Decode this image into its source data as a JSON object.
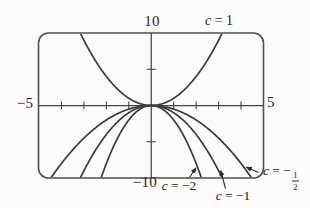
{
  "chart_data": {
    "type": "line",
    "model": "y = c*x^2 (family of parabolas, parameter c)",
    "x_range": [
      -5,
      5
    ],
    "y_range": [
      -10,
      10
    ],
    "x_tick_step": 1,
    "y_tick_step": 5,
    "grid": false,
    "legend": "inline-curve-labels",
    "axis_tick_labels": {
      "top": "10",
      "bottom": "−10",
      "left": "−5",
      "right": "5"
    },
    "series": [
      {
        "name": "c = 1",
        "c": 1,
        "points": [
          [
            -3,
            9
          ],
          [
            -2,
            4
          ],
          [
            -1,
            1
          ],
          [
            0,
            0
          ],
          [
            1,
            1
          ],
          [
            2,
            4
          ],
          [
            3,
            9
          ]
        ]
      },
      {
        "name": "c = −2",
        "c": -2,
        "points": [
          [
            -2,
            -8
          ],
          [
            -1,
            -2
          ],
          [
            0,
            0
          ],
          [
            1,
            -2
          ],
          [
            2,
            -8
          ]
        ]
      },
      {
        "name": "c = −1",
        "c": -1,
        "points": [
          [
            -3,
            -9
          ],
          [
            -2,
            -4
          ],
          [
            -1,
            -1
          ],
          [
            0,
            0
          ],
          [
            1,
            -1
          ],
          [
            2,
            -4
          ],
          [
            3,
            -9
          ]
        ]
      },
      {
        "name": "c = −1/2",
        "c": -0.5,
        "points": [
          [
            -4,
            -8
          ],
          [
            -3,
            -4.5
          ],
          [
            -2,
            -2
          ],
          [
            -1,
            -0.5
          ],
          [
            0,
            0
          ],
          [
            1,
            -0.5
          ],
          [
            2,
            -2
          ],
          [
            3,
            -4.5
          ],
          [
            4,
            -8
          ]
        ]
      }
    ],
    "curve_labels": {
      "c1": {
        "var": "c",
        "rest": " = 1"
      },
      "cm2": {
        "var": "c",
        "rest": " = −2"
      },
      "cm1": {
        "var": "c",
        "rest": " = −1"
      },
      "cmhalf": {
        "var": "c",
        "rest": " = −",
        "numerator": "1",
        "denominator": "2"
      }
    },
    "colors": {
      "stroke": "#3c3c3c",
      "border": "#4f4f4f",
      "axis": "#454545",
      "text": "#242424",
      "background": "#fcfbf9"
    }
  }
}
